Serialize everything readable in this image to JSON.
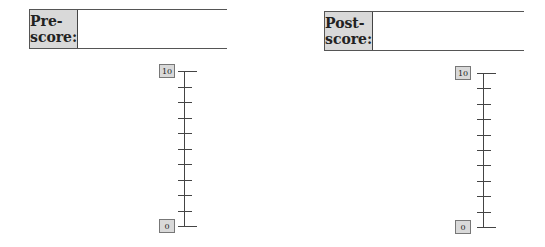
{
  "pre": {
    "label": "Pre-score:",
    "value": "",
    "scale": {
      "max_label": "10",
      "min_label": "0",
      "ticks": 11
    }
  },
  "post": {
    "label": "Post-score:",
    "value": "",
    "scale": {
      "max_label": "10",
      "min_label": "0",
      "ticks": 11
    }
  }
}
